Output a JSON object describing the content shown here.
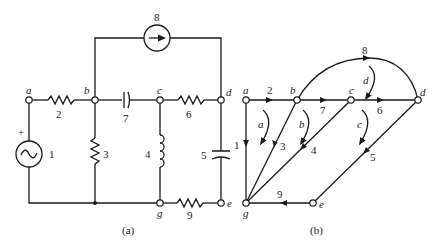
{
  "figure_a": {
    "caption": "(a)",
    "nodes": {
      "a": "a",
      "b": "b",
      "c": "c",
      "d": "d",
      "e": "e",
      "g": "g"
    },
    "elements": [
      {
        "id": "1",
        "type": "voltage-source",
        "polarity": "+",
        "between": [
          "a",
          "ground"
        ]
      },
      {
        "id": "2",
        "type": "resistor",
        "between": [
          "a",
          "b"
        ]
      },
      {
        "id": "3",
        "type": "resistor",
        "between": [
          "b",
          "ground"
        ]
      },
      {
        "id": "4",
        "type": "inductor",
        "between": [
          "c",
          "g"
        ]
      },
      {
        "id": "5",
        "type": "capacitor",
        "between": [
          "d",
          "e"
        ]
      },
      {
        "id": "6",
        "type": "resistor",
        "between": [
          "c",
          "d"
        ]
      },
      {
        "id": "7",
        "type": "capacitor",
        "between": [
          "b",
          "c"
        ]
      },
      {
        "id": "8",
        "type": "current-source",
        "between": [
          "b",
          "d"
        ]
      },
      {
        "id": "9",
        "type": "resistor",
        "between": [
          "g",
          "e"
        ]
      }
    ],
    "plus_sign": "+"
  },
  "figure_b": {
    "caption": "(b)",
    "nodes": {
      "a": "a",
      "b": "b",
      "c": "c",
      "d": "d",
      "e": "e",
      "g": "g"
    },
    "branches": [
      {
        "id": "1",
        "from": "a",
        "to": "g"
      },
      {
        "id": "2",
        "from": "a",
        "to": "b"
      },
      {
        "id": "3",
        "from": "b",
        "to": "g"
      },
      {
        "id": "4",
        "from": "c",
        "to": "g"
      },
      {
        "id": "5",
        "from": "d",
        "to": "e"
      },
      {
        "id": "6",
        "from": "c",
        "to": "d"
      },
      {
        "id": "7",
        "from": "b",
        "to": "c"
      },
      {
        "id": "8",
        "from": "b",
        "to": "d"
      },
      {
        "id": "9",
        "from": "e",
        "to": "g"
      }
    ],
    "meshes": [
      "a",
      "b",
      "c",
      "d"
    ]
  }
}
